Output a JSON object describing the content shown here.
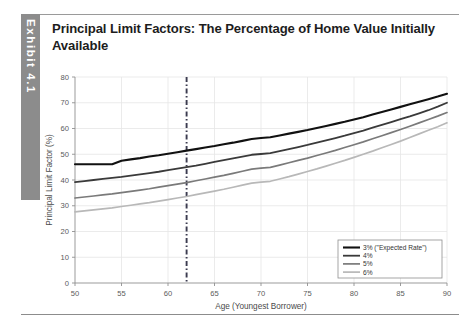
{
  "exhibit": {
    "spine_label": "Exhibit 4.1"
  },
  "title": "Principal Limit Factors: The Percentage of Home Value Initially Available",
  "chart_data": {
    "type": "line",
    "title": "Principal Limit Factors: The Percentage of Home Value Initially Available",
    "xlabel": "Age (Youngest Borrower)",
    "ylabel": "Principal Limit Factor (%)",
    "xlim": [
      50,
      90
    ],
    "ylim": [
      0,
      80
    ],
    "xticks": [
      50,
      55,
      60,
      65,
      70,
      75,
      80,
      85,
      90
    ],
    "yticks": [
      0,
      10,
      20,
      30,
      40,
      50,
      60,
      70,
      80
    ],
    "grid": true,
    "legend_position": "lower right",
    "annotations": [
      {
        "type": "vline",
        "x": 62,
        "style": "dash-dot",
        "color": "#3b3b4f",
        "label": "Age 62"
      }
    ],
    "x": [
      50,
      51,
      52,
      53,
      54,
      55,
      56,
      57,
      58,
      59,
      60,
      61,
      62,
      63,
      64,
      65,
      66,
      67,
      68,
      69,
      70,
      71,
      72,
      73,
      74,
      75,
      76,
      77,
      78,
      79,
      80,
      81,
      82,
      83,
      84,
      85,
      86,
      87,
      88,
      89,
      90
    ],
    "series": [
      {
        "name": "3% (\"Expected Rate\")",
        "color": "#111111",
        "width": 2.1,
        "values": [
          46.1,
          46.1,
          46.1,
          46.1,
          46.1,
          47.5,
          48.0,
          48.5,
          49.1,
          49.6,
          50.2,
          50.8,
          51.4,
          52.0,
          52.6,
          53.2,
          53.9,
          54.5,
          55.2,
          55.9,
          56.3,
          56.6,
          57.3,
          58.0,
          58.7,
          59.4,
          60.2,
          61.0,
          61.8,
          62.6,
          63.5,
          64.4,
          65.4,
          66.4,
          67.4,
          68.4,
          69.4,
          70.4,
          71.4,
          72.4,
          73.5
        ]
      },
      {
        "name": "4%",
        "color": "#3a3a3a",
        "width": 1.8,
        "values": [
          39.2,
          39.6,
          40.0,
          40.4,
          40.8,
          41.2,
          41.7,
          42.2,
          42.7,
          43.2,
          43.8,
          44.4,
          45.0,
          45.6,
          46.3,
          47.0,
          47.7,
          48.4,
          49.1,
          49.8,
          50.1,
          50.4,
          51.2,
          52.0,
          52.8,
          53.6,
          54.5,
          55.4,
          56.3,
          57.2,
          58.2,
          59.2,
          60.3,
          61.4,
          62.5,
          63.6,
          64.7,
          65.9,
          67.1,
          68.5,
          70.0
        ]
      },
      {
        "name": "5%",
        "color": "#7a7a7a",
        "width": 1.7,
        "values": [
          33.0,
          33.4,
          33.8,
          34.2,
          34.6,
          35.1,
          35.6,
          36.1,
          36.6,
          37.2,
          37.8,
          38.4,
          39.0,
          39.7,
          40.4,
          41.1,
          41.8,
          42.6,
          43.4,
          44.2,
          44.6,
          44.9,
          45.8,
          46.7,
          47.6,
          48.5,
          49.5,
          50.5,
          51.5,
          52.6,
          53.7,
          54.8,
          56.0,
          57.2,
          58.4,
          59.6,
          60.9,
          62.2,
          63.5,
          64.8,
          66.2
        ]
      },
      {
        "name": "6%",
        "color": "#b8b8b8",
        "width": 1.7,
        "values": [
          27.6,
          28.0,
          28.4,
          28.8,
          29.2,
          29.7,
          30.2,
          30.7,
          31.2,
          31.8,
          32.4,
          33.0,
          33.6,
          34.3,
          35.0,
          35.7,
          36.4,
          37.2,
          38.0,
          38.8,
          39.2,
          39.5,
          40.4,
          41.3,
          42.3,
          43.3,
          44.3,
          45.4,
          46.5,
          47.6,
          48.8,
          50.0,
          51.2,
          52.5,
          53.8,
          55.1,
          56.5,
          57.9,
          59.3,
          60.7,
          62.2
        ]
      }
    ]
  }
}
